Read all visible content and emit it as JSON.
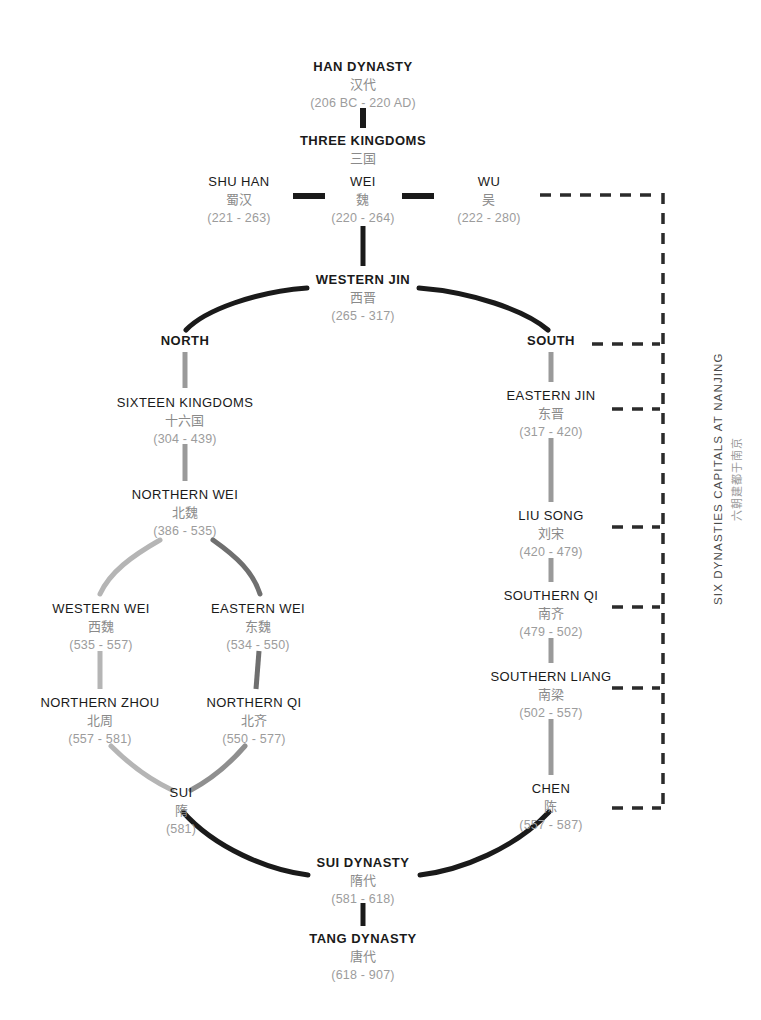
{
  "diagram": {
    "title_en": "HAN DYNASTY",
    "nodes": [
      {
        "id": "han",
        "en": "HAN DYNASTY",
        "zh": "汉代",
        "years": "(206 BC - 220 AD)",
        "x": 363,
        "y": 60,
        "bold": true
      },
      {
        "id": "three-kingdoms",
        "en": "THREE KINGDOMS",
        "zh": "三国",
        "years": "",
        "x": 363,
        "y": 134,
        "bold": true
      },
      {
        "id": "shu-han",
        "en": "SHU HAN",
        "zh": "蜀汉",
        "years": "(221 - 263)",
        "x": 239,
        "y": 175,
        "bold": false
      },
      {
        "id": "wei",
        "en": "WEI",
        "zh": "魏",
        "years": "(220 - 264)",
        "x": 363,
        "y": 175,
        "bold": false
      },
      {
        "id": "wu",
        "en": "WU",
        "zh": "吴",
        "years": "(222 - 280)",
        "x": 489,
        "y": 175,
        "bold": false
      },
      {
        "id": "western-jin",
        "en": "WESTERN JIN",
        "zh": "西晋",
        "years": "(265 - 317)",
        "x": 363,
        "y": 273,
        "bold": true
      },
      {
        "id": "north",
        "en": "NORTH",
        "zh": "",
        "years": "",
        "x": 185,
        "y": 334,
        "bold": true
      },
      {
        "id": "south",
        "en": "SOUTH",
        "zh": "",
        "years": "",
        "x": 551,
        "y": 334,
        "bold": true
      },
      {
        "id": "sixteen",
        "en": "SIXTEEN KINGDOMS",
        "zh": "十六国",
        "years": "(304 - 439)",
        "x": 185,
        "y": 396,
        "bold": false
      },
      {
        "id": "northern-wei",
        "en": "NORTHERN WEI",
        "zh": "北魏",
        "years": "(386 - 535)",
        "x": 185,
        "y": 488,
        "bold": false
      },
      {
        "id": "western-wei",
        "en": "WESTERN WEI",
        "zh": "西魏",
        "years": "(535 - 557)",
        "x": 101,
        "y": 602,
        "bold": false
      },
      {
        "id": "eastern-wei",
        "en": "EASTERN WEI",
        "zh": "东魏",
        "years": "(534 - 550)",
        "x": 258,
        "y": 602,
        "bold": false
      },
      {
        "id": "northern-zhou",
        "en": "NORTHERN ZHOU",
        "zh": "北周",
        "years": "(557 - 581)",
        "x": 100,
        "y": 696,
        "bold": false
      },
      {
        "id": "northern-qi",
        "en": "NORTHERN QI",
        "zh": "北齐",
        "years": "(550 - 577)",
        "x": 254,
        "y": 696,
        "bold": false
      },
      {
        "id": "sui",
        "en": "SUI",
        "zh": "隋",
        "years": "(581)",
        "x": 181,
        "y": 786,
        "bold": false
      },
      {
        "id": "eastern-jin",
        "en": "EASTERN JIN",
        "zh": "东晋",
        "years": "(317 - 420)",
        "x": 551,
        "y": 389,
        "bold": false
      },
      {
        "id": "liu-song",
        "en": "LIU SONG",
        "zh": "刘宋",
        "years": "(420 - 479)",
        "x": 551,
        "y": 509,
        "bold": false
      },
      {
        "id": "southern-qi",
        "en": "SOUTHERN QI",
        "zh": "南齐",
        "years": "(479 - 502)",
        "x": 551,
        "y": 589,
        "bold": false
      },
      {
        "id": "southern-liang",
        "en": "SOUTHERN LIANG",
        "zh": "南梁",
        "years": "(502 - 557)",
        "x": 551,
        "y": 670,
        "bold": false
      },
      {
        "id": "chen",
        "en": "CHEN",
        "zh": "陈",
        "years": "(557 - 587)",
        "x": 551,
        "y": 782,
        "bold": false
      },
      {
        "id": "sui-dynasty",
        "en": "SUI DYNASTY",
        "zh": "隋代",
        "years": "(581 - 618)",
        "x": 363,
        "y": 856,
        "bold": true
      },
      {
        "id": "tang-dynasty",
        "en": "TANG DYNASTY",
        "zh": "唐代",
        "years": "(618 - 907)",
        "x": 363,
        "y": 932,
        "bold": true
      }
    ],
    "side_label": {
      "en": "SIX DYNASTIES CAPITALS AT NANJING",
      "zh": "六朝建都于南京"
    },
    "colors": {
      "dark": "#1a1a1a",
      "gray_line": "#9a9a9a",
      "gray_line_light": "#b5b5b5",
      "gray_line_dark": "#6f6f6f",
      "dashed": "#2b2b2b",
      "zh_text": "#8a8a8a",
      "year_text": "#9c9c9c"
    }
  }
}
